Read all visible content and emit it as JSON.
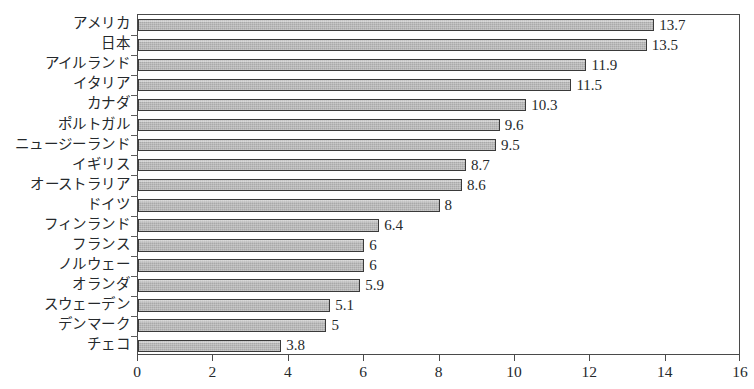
{
  "chart": {
    "type": "bar",
    "orientation": "horizontal",
    "background_color": "#ffffff",
    "bar_fill_color": "#a9a9a9",
    "bar_border_color": "#3a3a3a",
    "axis_color": "#4a4a4a",
    "text_color": "#25292c"
  },
  "chart_data": {
    "type": "bar",
    "title": "",
    "xlabel": "",
    "ylabel": "",
    "xlim": [
      0,
      16
    ],
    "ylim": null,
    "grid": false,
    "legend": null,
    "orientation": "horizontal",
    "categories": [
      "アメリカ",
      "日本",
      "アイルランド",
      "イタリア",
      "カナダ",
      "ポルトガル",
      "ニュージーランド",
      "イギリス",
      "オーストラリア",
      "ドイツ",
      "フィンランド",
      "フランス",
      "ノルウェー",
      "オランダ",
      "スウェーデン",
      "デンマーク",
      "チェコ"
    ],
    "values": [
      13.7,
      13.5,
      11.9,
      11.5,
      10.3,
      9.6,
      9.5,
      8.7,
      8.6,
      8,
      6.4,
      6,
      6,
      5.9,
      5.1,
      5,
      3.8
    ],
    "data_labels": [
      "13.7",
      "13.5",
      "11.9",
      "11.5",
      "10.3",
      "9.6",
      "9.5",
      "8.7",
      "8.6",
      "8",
      "6.4",
      "6",
      "6",
      "5.9",
      "5.1",
      "5",
      "3.8"
    ],
    "xticks": [
      0,
      2,
      4,
      6,
      8,
      10,
      12,
      14,
      16
    ],
    "xtick_labels": [
      "0",
      "2",
      "4",
      "6",
      "8",
      "10",
      "12",
      "14",
      "16"
    ]
  }
}
